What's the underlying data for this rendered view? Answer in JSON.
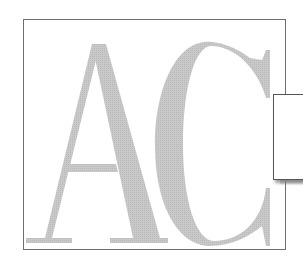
{
  "logo": {
    "monogram": "AC",
    "letter_1": "A",
    "letter_2": "C",
    "letter_color": "#c6c6c6",
    "frame_border_color": "#6e6e6e",
    "tab_border_color": "#555555",
    "background": "#ffffff"
  }
}
